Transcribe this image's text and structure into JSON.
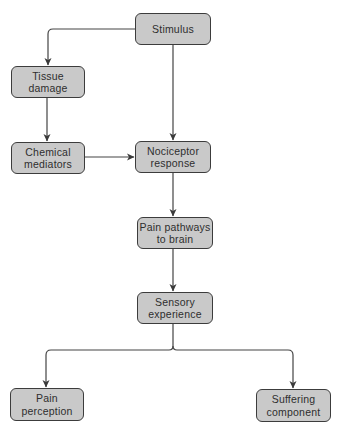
{
  "diagram": {
    "type": "flowchart",
    "nodes": {
      "stimulus": "Stimulus",
      "tissue_damage": "Tissue\ndamage",
      "chemical_mediators": "Chemical\nmediators",
      "nociceptor_response": "Nociceptor\nresponse",
      "pain_pathways": "Pain pathways\nto brain",
      "sensory_experience": "Sensory\nexperience",
      "pain_perception": "Pain\nperception",
      "suffering_component": "Suffering\ncomponent"
    },
    "edges": [
      [
        "Stimulus",
        "Tissue damage"
      ],
      [
        "Stimulus",
        "Nociceptor response"
      ],
      [
        "Tissue damage",
        "Chemical mediators"
      ],
      [
        "Chemical mediators",
        "Nociceptor response"
      ],
      [
        "Nociceptor response",
        "Pain pathways to brain"
      ],
      [
        "Pain pathways to brain",
        "Sensory experience"
      ],
      [
        "Sensory experience",
        "Pain perception"
      ],
      [
        "Sensory experience",
        "Suffering component"
      ]
    ],
    "colors": {
      "node_fill": "#c9c9c9",
      "node_border": "#3c3c3c",
      "line": "#444444",
      "text": "#2e2e2e"
    }
  }
}
